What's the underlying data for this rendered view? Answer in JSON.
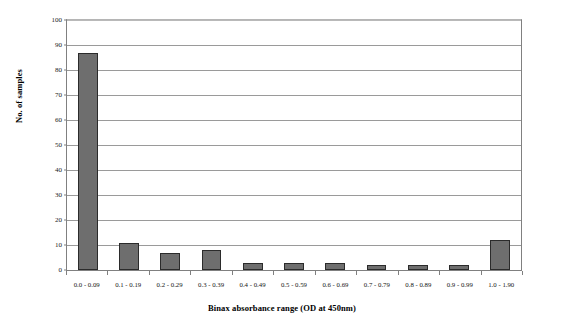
{
  "chart_data": {
    "type": "bar",
    "title": "",
    "xlabel": "Binax absorbance range (OD at 450nm)",
    "ylabel": "No. of samples",
    "categories": [
      "0.0 - 0.09",
      "0.1 - 0.19",
      "0.2 - 0.29",
      "0.3 - 0.39",
      "0.4 - 0.49",
      "0.5 - 0.59",
      "0.6 - 0.69",
      "0.7 - 0.79",
      "0.8 - 0.89",
      "0.9 - 0.99",
      "1.0 - 1.90"
    ],
    "values": [
      87,
      11,
      7,
      8,
      3,
      3,
      3,
      2,
      2,
      2,
      12
    ],
    "ylim": [
      0,
      100
    ],
    "yticks": [
      0,
      10,
      20,
      30,
      40,
      50,
      60,
      70,
      80,
      90,
      100
    ],
    "ytick_labels": [
      "0",
      "10",
      "20",
      "30",
      "40",
      "50",
      "60",
      "70",
      "80",
      "90",
      "100"
    ],
    "grid": "horizontal",
    "legend": "none",
    "bar_color": "#6e6e6e",
    "bar_border_color": "#2b2b2b",
    "gridline_color": "#9a9a9a",
    "axis_color": "#808080",
    "background": "#ffffff"
  }
}
